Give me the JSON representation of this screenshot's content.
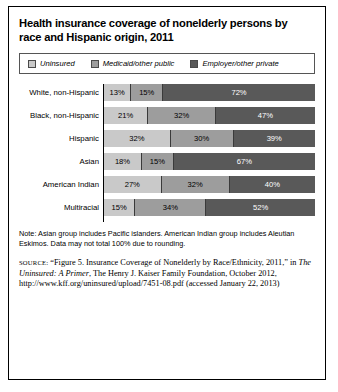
{
  "figure": {
    "title": "Health insurance coverage of nonelderly persons by race and Hispanic origin, 2011",
    "note": "Note: Asian group includes Pacific islanders. American Indian group includes Aleutian Eskimos. Data may not total 100% due to rounding.",
    "source": {
      "kicker": "SOURCE:",
      "part1": " “Figure 5. Insurance Coverage of Nonelderly by Race/Ethnicity, 2011,” in ",
      "title_italic": "The Uninsured: A Primer",
      "part2": ", The Henry J. Kaiser Family Foundation, October 2012, http://www.kff.org/uninsured/upload/7451-08.pdf (accessed January 22, 2013)"
    }
  },
  "colors": {
    "uninsured": "#c9c9c9",
    "medicaid": "#9d9d9d",
    "employer": "#595959",
    "border": "#000000"
  },
  "chart_data": {
    "type": "bar",
    "title": "Health insurance coverage of nonelderly persons by race and Hispanic origin, 2011",
    "xlabel": "",
    "ylabel": "",
    "xlim": [
      0,
      100
    ],
    "grid": false,
    "stacked": true,
    "orientation": "horizontal",
    "legend_position": "top",
    "unit": "%",
    "categories": [
      "White, non-Hispanic",
      "Black, non-Hispanic",
      "Hispanic",
      "Asian",
      "American Indian",
      "Multiracial"
    ],
    "series": [
      {
        "name": "Uninsured",
        "values": [
          13,
          21,
          32,
          18,
          27,
          15
        ]
      },
      {
        "name": "Medicaid/other public",
        "values": [
          15,
          32,
          30,
          15,
          32,
          34
        ]
      },
      {
        "name": "Employer/other private",
        "values": [
          72,
          47,
          39,
          67,
          40,
          52
        ]
      }
    ],
    "data_labels": [
      [
        "13%",
        "15%",
        "72%"
      ],
      [
        "21%",
        "32%",
        "47%"
      ],
      [
        "32%",
        "30%",
        "39%"
      ],
      [
        "18%",
        "15%",
        "67%"
      ],
      [
        "27%",
        "32%",
        "40%"
      ],
      [
        "15%",
        "34%",
        "52%"
      ]
    ]
  }
}
